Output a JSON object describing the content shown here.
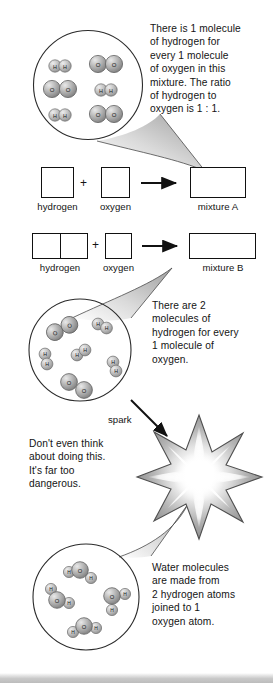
{
  "page": {
    "background_color": "#ffffff",
    "ink_color": "#141414"
  },
  "callouts": [
    {
      "id": "callout-mixture-a",
      "text": "There is 1 molecule\nof hydrogen for\nevery 1 molecule\nof oxygen in this\nmixture. The ratio\nof hydrogen to\noxygen is 1 : 1."
    },
    {
      "id": "callout-mixture-b",
      "text": "There are 2\nmolecules of\nhydrogen for every\n1 molecule of\noxygen."
    },
    {
      "id": "callout-danger",
      "text": "Don't even think\nabout doing this.\nIt's far too\ndangerous."
    },
    {
      "id": "callout-water",
      "text": "Water molecules\nare made from\n2 hydrogen atoms\njoined to 1\noxygen atom."
    }
  ],
  "equations": [
    {
      "id": "equation-mixture-a",
      "reactant_1": {
        "label": "hydrogen",
        "cells": 1
      },
      "operator": "+",
      "reactant_2": {
        "label": "oxygen",
        "cells": 1
      },
      "arrow": "right-arrow",
      "product": {
        "label": "mixture A",
        "cells": 1
      }
    },
    {
      "id": "equation-mixture-b",
      "reactant_1": {
        "label": "hydrogen",
        "cells": 2
      },
      "operator": "+",
      "reactant_2": {
        "label": "oxygen",
        "cells": 1
      },
      "arrow": "right-arrow",
      "product": {
        "label": "mixture B",
        "cells": 1
      }
    }
  ],
  "spark": {
    "label": "spark"
  },
  "magnifiers": [
    {
      "id": "magnifier-mixture-a",
      "ratio_hydrogen": 1,
      "ratio_oxygen": 1,
      "molecules": [
        {
          "type": "H2",
          "atoms": [
            "H",
            "H"
          ]
        },
        {
          "type": "O2",
          "atoms": [
            "O",
            "O"
          ]
        },
        {
          "type": "O2",
          "atoms": [
            "O",
            "O"
          ]
        },
        {
          "type": "H2",
          "atoms": [
            "H",
            "H"
          ]
        },
        {
          "type": "H2",
          "atoms": [
            "H",
            "H"
          ]
        },
        {
          "type": "O2",
          "atoms": [
            "O",
            "O"
          ]
        }
      ]
    },
    {
      "id": "magnifier-mixture-b",
      "ratio_hydrogen": 2,
      "ratio_oxygen": 1,
      "molecules": [
        {
          "type": "O2",
          "atoms": [
            "O",
            "O"
          ]
        },
        {
          "type": "H2",
          "atoms": [
            "H",
            "H"
          ]
        },
        {
          "type": "H2",
          "atoms": [
            "H",
            "H"
          ]
        },
        {
          "type": "H2",
          "atoms": [
            "H",
            "H"
          ]
        },
        {
          "type": "H2",
          "atoms": [
            "H",
            "H"
          ]
        },
        {
          "type": "O2",
          "atoms": [
            "O",
            "O"
          ]
        }
      ]
    },
    {
      "id": "magnifier-water",
      "molecules": [
        {
          "type": "H2O",
          "atoms": [
            "H",
            "O",
            "H"
          ]
        },
        {
          "type": "H2O",
          "atoms": [
            "H",
            "O",
            "H"
          ]
        },
        {
          "type": "H2O",
          "atoms": [
            "H",
            "O",
            "H"
          ]
        },
        {
          "type": "H2O",
          "atoms": [
            "H",
            "O",
            "H"
          ]
        }
      ]
    }
  ],
  "atom_labels": {
    "hydrogen": "H",
    "oxygen": "O"
  },
  "colors": {
    "outline": "#111111",
    "atom_fill_light": "#dcdcdc",
    "atom_fill_mid": "#a8a8a8",
    "atom_fill_dark": "#7a7a7a",
    "cone_fill": "#c9c9c9",
    "bottom_bar": "#c4c4c4"
  }
}
